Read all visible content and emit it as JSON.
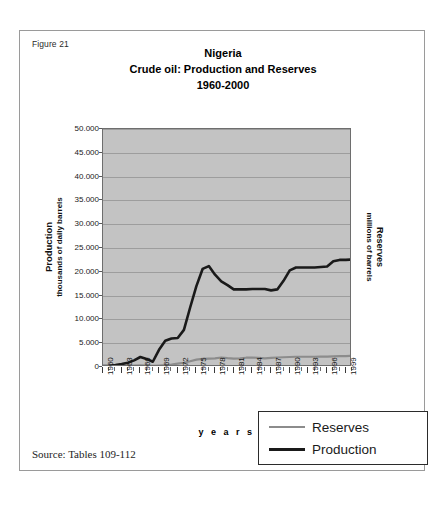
{
  "figure": {
    "number_label": "Figure 21",
    "source_note": "Source: Tables 109-112"
  },
  "chart_data": {
    "type": "line",
    "title": "Nigeria\nCrude oil: Production and Reserves\n1960-2000",
    "title_lines": [
      "Nigeria",
      "Crude oil: Production and Reserves",
      "1960-2000"
    ],
    "xlabel": "y e a r s",
    "ylabel": "Production",
    "ylabel_sub": "thousands of daily barrels",
    "y2label": "Reserves",
    "y2label_sub": "millions of barrels",
    "ylim": [
      0,
      50000
    ],
    "yticks": [
      0,
      5000,
      10000,
      15000,
      20000,
      25000,
      30000,
      35000,
      40000,
      45000,
      50000
    ],
    "ytick_labels": [
      "0",
      "5.000",
      "10.000",
      "15.000",
      "20.000",
      "25.000",
      "30.000",
      "35.000",
      "40.000",
      "45.000",
      "50.000"
    ],
    "grid": true,
    "legend_position": "below-right",
    "xlim": [
      1960,
      2000
    ],
    "x": [
      1960,
      1961,
      1962,
      1963,
      1964,
      1965,
      1966,
      1967,
      1968,
      1969,
      1970,
      1971,
      1972,
      1973,
      1974,
      1975,
      1976,
      1977,
      1978,
      1979,
      1980,
      1981,
      1982,
      1983,
      1984,
      1985,
      1986,
      1987,
      1988,
      1989,
      1990,
      1991,
      1992,
      1993,
      1994,
      1995,
      1996,
      1997,
      1998,
      1999,
      2000
    ],
    "xtick_labels": [
      "1960",
      "1963",
      "1966",
      "1969",
      "1972",
      "1975",
      "1978",
      "1981",
      "1984",
      "1987",
      "1990",
      "1993",
      "1996",
      "1999"
    ],
    "xtick_values": [
      1960,
      1963,
      1966,
      1969,
      1972,
      1975,
      1978,
      1981,
      1984,
      1987,
      1990,
      1993,
      1996,
      1999
    ],
    "series": [
      {
        "name": "Production",
        "color": "#1a1a1a",
        "values": [
          200,
          250,
          400,
          600,
          900,
          1400,
          2100,
          1700,
          1100,
          3600,
          5500,
          6000,
          6100,
          7800,
          12500,
          17000,
          20600,
          21200,
          19400,
          18000,
          17200,
          16300,
          16300,
          16300,
          16400,
          16400,
          16400,
          16100,
          16300,
          18100,
          20300,
          20900,
          20900,
          20900,
          20900,
          21000,
          21100,
          22200,
          22500,
          22500,
          22600
        ]
      },
      {
        "name": "Reserves",
        "color": "#8c8c8c",
        "values": [
          150,
          160,
          180,
          200,
          230,
          280,
          340,
          300,
          260,
          320,
          400,
          520,
          700,
          900,
          1200,
          1550,
          1700,
          1750,
          1800,
          2000,
          1850,
          1750,
          1800,
          1950,
          2000,
          1900,
          1800,
          1900,
          2000,
          2050,
          2100,
          2150,
          2150,
          2150,
          2150,
          2200,
          2200,
          2250,
          2300,
          2300,
          2350
        ]
      }
    ]
  },
  "legend": {
    "items": [
      {
        "label": "Reserves"
      },
      {
        "label": "Production"
      }
    ]
  }
}
